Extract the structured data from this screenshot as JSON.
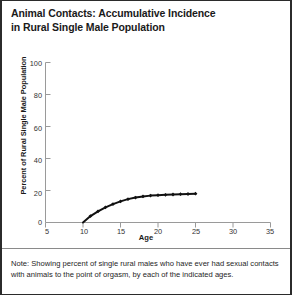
{
  "title": "Animal Contacts: Accumulative Incidence in Rural Single Male Population",
  "title_line1": "Animal Contacts: Accumulative Incidence",
  "title_line2": "in Rural Single Male Population",
  "note": "Note: Showing percent of single rural males who have ever had sexual contacts with animals to the point of orgasm, by each of the indicated ages.",
  "axes": {
    "xlabel": "Age",
    "ylabel": "Percent of Rural Single Male Population",
    "xticks": [
      "5",
      "10",
      "15",
      "20",
      "25",
      "30",
      "35"
    ],
    "yticks": [
      "0",
      "20",
      "40",
      "60",
      "80",
      "100"
    ]
  },
  "colors": {
    "line": "#111111",
    "marker": "#111111",
    "axis": "#9a9a9a",
    "text": "#1a1a1a",
    "border": "#2b2b2b",
    "background": "#ffffff"
  },
  "chart_data": {
    "type": "line",
    "title": "Animal Contacts: Accumulative Incidence in Rural Single Male Population",
    "xlabel": "Age",
    "ylabel": "Percent of Rural Single Male Population",
    "xlim": [
      5,
      35
    ],
    "ylim": [
      0,
      100
    ],
    "xticks": [
      5,
      10,
      15,
      20,
      25,
      30,
      35
    ],
    "yticks": [
      0,
      20,
      40,
      60,
      80,
      100
    ],
    "grid": false,
    "legend": null,
    "marker": "diamond",
    "series": [
      {
        "name": "Accumulative incidence",
        "x": [
          10,
          11,
          12,
          13,
          14,
          15,
          16,
          17,
          18,
          19,
          20,
          21,
          22,
          23,
          24,
          25
        ],
        "values": [
          0.0,
          4.0,
          7.0,
          9.5,
          11.5,
          13.2,
          14.6,
          15.6,
          16.3,
          16.8,
          17.1,
          17.3,
          17.5,
          17.7,
          17.8,
          18.0
        ]
      }
    ]
  }
}
